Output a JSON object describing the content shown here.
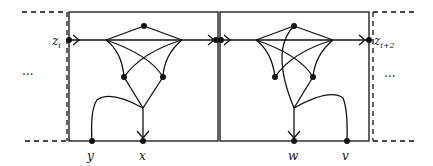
{
  "diagram": {
    "type": "graph-gadget-chain",
    "background": "#ffffff",
    "stroke": "#111111",
    "labels": {
      "z_left": "z",
      "z_left_sub": "i",
      "z_right": "z",
      "z_right_sub": "i+2",
      "y": "y",
      "x": "x",
      "w": "w",
      "v": "v",
      "ellipsis_left": "···",
      "ellipsis_right": "···"
    },
    "boxes": [
      {
        "name": "left-gadget",
        "terminals": [
          "z_i",
          "y",
          "x"
        ]
      },
      {
        "name": "right-gadget",
        "terminals": [
          "z_i+2",
          "w",
          "v"
        ]
      }
    ]
  }
}
